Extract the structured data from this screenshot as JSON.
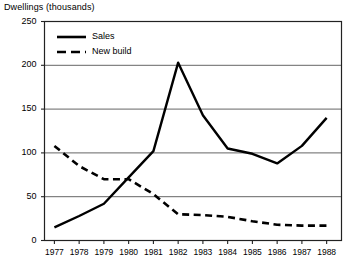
{
  "chart_data": {
    "type": "line",
    "title": "Dwellings (thousands)",
    "xlabel": "",
    "ylabel": "Dwellings (thousands)",
    "x": [
      1977,
      1978,
      1979,
      1980,
      1981,
      1982,
      1983,
      1984,
      1985,
      1986,
      1987,
      1988
    ],
    "xtick_labels": [
      "1977",
      "1978",
      "1979",
      "1980",
      "1981",
      "1982",
      "1983",
      "1984",
      "1985",
      "1986",
      "1987",
      "1988"
    ],
    "ytick_labels": [
      "0",
      "50",
      "100",
      "150",
      "200",
      "250"
    ],
    "yticks": [
      0,
      50,
      100,
      150,
      200,
      250
    ],
    "ylim": [
      0,
      250
    ],
    "xlim": [
      1976.6,
      1988.6
    ],
    "grid": "horizontal",
    "legend_position": "top-left-inside",
    "series": [
      {
        "name": "Sales",
        "style": "solid",
        "color": "#000000",
        "values": [
          15,
          28,
          42,
          72,
          102,
          203,
          143,
          105,
          99,
          88,
          108,
          140
        ]
      },
      {
        "name": "New build",
        "style": "dashed",
        "color": "#000000",
        "values": [
          108,
          85,
          70,
          70,
          53,
          30,
          29,
          27,
          22,
          18,
          17,
          17
        ]
      }
    ]
  },
  "legend": {
    "items": [
      {
        "label": "Sales",
        "style": "solid"
      },
      {
        "label": "New build",
        "style": "dashed"
      }
    ]
  }
}
